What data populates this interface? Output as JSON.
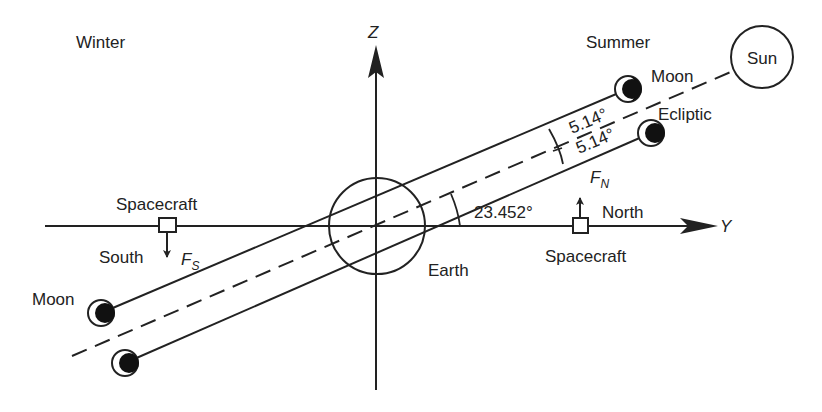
{
  "diagram": {
    "colors": {
      "line": "#222222",
      "background": "#ffffff",
      "moon_fill": "#111111"
    },
    "labels": {
      "winter": "Winter",
      "summer": "Summer",
      "z_axis": "Z",
      "y_axis": "Y",
      "sun": "Sun",
      "moon_upper": "Moon",
      "moon_lower": "Moon",
      "ecliptic": "Ecliptic",
      "angle_upper": "5.14°",
      "angle_lower": "5.14°",
      "obliquity": "23.452°",
      "force_north": "F",
      "force_north_sub": "N",
      "force_south": "F",
      "force_south_sub": "S",
      "north": "North",
      "south": "South",
      "spacecraft_right": "Spacecraft",
      "spacecraft_left": "Spacecraft",
      "earth": "Earth"
    }
  }
}
